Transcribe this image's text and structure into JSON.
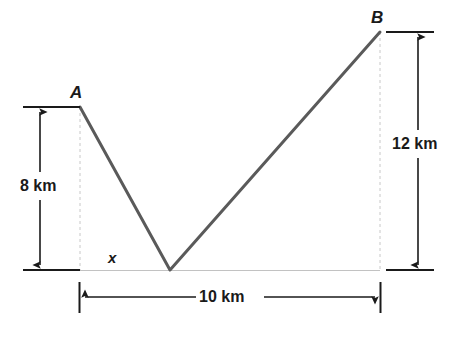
{
  "diagram": {
    "type": "geometry-diagram",
    "colors": {
      "path_stroke": "#5a5a5a",
      "guide_stroke": "#c8c8c8",
      "dimension_stroke": "#1a1a1a",
      "background": "#ffffff",
      "text": "#1a1a1a"
    },
    "points": {
      "A": {
        "label": "A",
        "x": 80,
        "y": 107
      },
      "B": {
        "label": "B",
        "x": 380,
        "y": 32
      },
      "V": {
        "label": "",
        "x": 170,
        "y": 270
      }
    },
    "baseline": {
      "y": 270,
      "x_start": 80,
      "x_end": 380
    },
    "dimensions": [
      {
        "id": "left-vertical",
        "label": "8 km",
        "value": 8,
        "unit": "km",
        "orientation": "vertical",
        "measures": "height of A above baseline"
      },
      {
        "id": "right-vertical",
        "label": "12 km",
        "value": 12,
        "unit": "km",
        "orientation": "vertical",
        "measures": "height of B above baseline"
      },
      {
        "id": "bottom-horizontal",
        "label": "10 km",
        "value": 10,
        "unit": "km",
        "orientation": "horizontal",
        "measures": "horizontal distance from A foot to B foot"
      }
    ],
    "variables": [
      {
        "id": "x",
        "label": "x",
        "measures": "horizontal distance from A foot to vertex V"
      }
    ]
  }
}
